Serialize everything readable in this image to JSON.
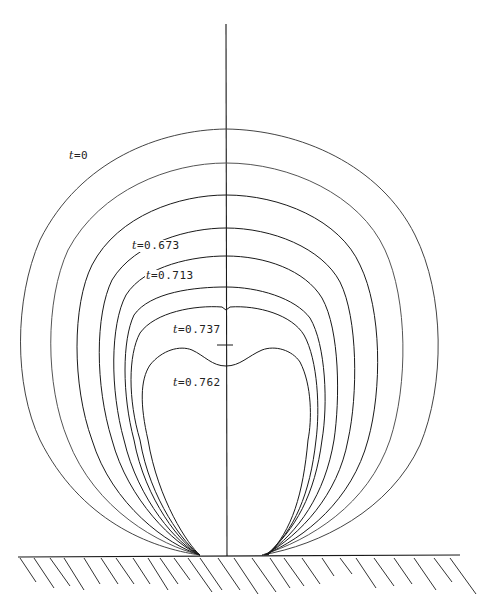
{
  "figure": {
    "axis_of_symmetry": true,
    "wall": "hatched solid boundary",
    "line_color": "#1a1a1a"
  },
  "labels": [
    {
      "var": "t",
      "text": "=0",
      "x": 68,
      "y": 155
    },
    {
      "var": "t",
      "text": "=0.673",
      "x": 131,
      "y": 245
    },
    {
      "var": "t",
      "text": "=0.713",
      "x": 145,
      "y": 275
    },
    {
      "var": "t",
      "text": "=0.737",
      "x": 172,
      "y": 329
    },
    {
      "var": "t",
      "text": "=0.762",
      "x": 172,
      "y": 382
    }
  ],
  "curves": [
    {
      "name": "t=0",
      "top": 129,
      "left": 16,
      "right": 436
    },
    {
      "name": "curve-2",
      "top": 163,
      "left": 47,
      "right": 404
    },
    {
      "name": "curve-3",
      "top": 195,
      "left": 73,
      "right": 380
    },
    {
      "name": "t=0.673",
      "top": 228,
      "left": 96,
      "right": 357
    },
    {
      "name": "t=0.713",
      "top": 256,
      "left": 112,
      "right": 340
    },
    {
      "name": "curve-6",
      "top": 287,
      "left": 124,
      "right": 326
    },
    {
      "name": "t=0.737",
      "top": 307,
      "left": 130,
      "right": 318
    },
    {
      "name": "t=0.762",
      "top": 366,
      "left": 140,
      "right": 304
    }
  ]
}
